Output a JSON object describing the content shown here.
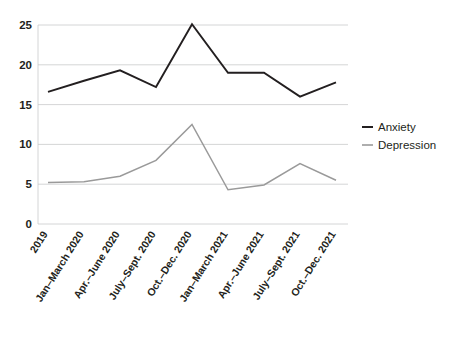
{
  "chart_data": {
    "type": "line",
    "title": "",
    "subtitle": "",
    "xlabel": "",
    "ylabel": "",
    "grid": true,
    "legend_position": "right",
    "ylim": [
      0,
      25
    ],
    "yticks": [
      0,
      5,
      10,
      15,
      20,
      25
    ],
    "categories": [
      "2019",
      "Jan–March 2020",
      "Apr.–June 2020",
      "July–Sept. 2020",
      "Oct.–Dec. 2020",
      "Jan–March 2021",
      "Apr.–June 2021",
      "July–Sept. 2021",
      "Oct.–Dec. 2021"
    ],
    "series": [
      {
        "name": "Anxiety",
        "color": "#231f20",
        "values": [
          16.6,
          18.0,
          19.3,
          17.2,
          25.1,
          19.0,
          19.0,
          16.0,
          17.8
        ]
      },
      {
        "name": "Depression",
        "color": "#9a9a9a",
        "values": [
          5.2,
          5.3,
          6.0,
          8.0,
          12.5,
          4.3,
          4.9,
          7.6,
          5.5
        ]
      }
    ]
  },
  "legend": {
    "items": [
      {
        "label": "Anxiety",
        "color": "#231f20"
      },
      {
        "label": "Depression",
        "color": "#9a9a9a"
      }
    ]
  },
  "axes": {
    "y_tick_labels": [
      "25",
      "20",
      "15",
      "10",
      "5",
      "0"
    ],
    "x_tick_labels": [
      "2019",
      "Jan–March 2020",
      "Apr.–June 2020",
      "July–Sept. 2020",
      "Oct.–Dec. 2020",
      "Jan–March 2021",
      "Apr.–June 2021",
      "July–Sept. 2021",
      "Oct.–Dec. 2021"
    ]
  },
  "colors": {
    "background": "#ffffff",
    "grid": "#c9cacb",
    "anxiety": "#231f20",
    "depression": "#9a9a9a",
    "text": "#231f20"
  }
}
